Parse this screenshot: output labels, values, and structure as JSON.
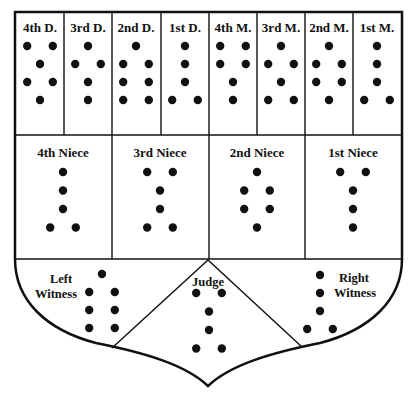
{
  "diagram": {
    "type": "shield",
    "top_row": [
      {
        "label": "4th D.",
        "dots": [
          [
            -8,
            0
          ],
          [
            8,
            0
          ],
          [
            0,
            1
          ],
          [
            -8,
            2
          ],
          [
            8,
            2
          ],
          [
            0,
            3
          ]
        ]
      },
      {
        "label": "3rd D.",
        "dots": [
          [
            0,
            0
          ],
          [
            -8,
            1
          ],
          [
            8,
            1
          ],
          [
            0,
            2
          ],
          [
            0,
            3
          ]
        ]
      },
      {
        "label": "2nd D.",
        "dots": [
          [
            0,
            0
          ],
          [
            -8,
            1
          ],
          [
            8,
            1
          ],
          [
            -8,
            2
          ],
          [
            8,
            2
          ],
          [
            -8,
            3
          ],
          [
            8,
            3
          ]
        ]
      },
      {
        "label": "1st D.",
        "dots": [
          [
            0,
            0
          ],
          [
            0,
            1
          ],
          [
            0,
            2
          ],
          [
            -8,
            3
          ],
          [
            8,
            3
          ]
        ]
      },
      {
        "label": "4th M.",
        "dots": [
          [
            -8,
            0
          ],
          [
            8,
            0
          ],
          [
            -8,
            1
          ],
          [
            8,
            1
          ],
          [
            0,
            2
          ],
          [
            0,
            3
          ]
        ]
      },
      {
        "label": "3rd M.",
        "dots": [
          [
            0,
            0
          ],
          [
            -8,
            1
          ],
          [
            8,
            1
          ],
          [
            0,
            2
          ],
          [
            -8,
            3
          ],
          [
            8,
            3
          ]
        ]
      },
      {
        "label": "2nd M.",
        "dots": [
          [
            0,
            0
          ],
          [
            -8,
            1
          ],
          [
            8,
            1
          ],
          [
            -8,
            2
          ],
          [
            8,
            2
          ],
          [
            0,
            3
          ]
        ]
      },
      {
        "label": "1st M.",
        "dots": [
          [
            0,
            0
          ],
          [
            0,
            1
          ],
          [
            0,
            2
          ],
          [
            -8,
            3
          ],
          [
            8,
            3
          ]
        ]
      }
    ],
    "middle_row": [
      {
        "label": "4th Niece",
        "dots": [
          [
            0,
            0
          ],
          [
            0,
            1
          ],
          [
            0,
            2
          ],
          [
            -8,
            3
          ],
          [
            8,
            3
          ]
        ]
      },
      {
        "label": "3rd Niece",
        "dots": [
          [
            -8,
            0
          ],
          [
            8,
            0
          ],
          [
            0,
            1
          ],
          [
            0,
            2
          ],
          [
            -8,
            3
          ],
          [
            8,
            3
          ]
        ]
      },
      {
        "label": "2nd Niece",
        "dots": [
          [
            0,
            0
          ],
          [
            -8,
            1
          ],
          [
            8,
            1
          ],
          [
            -8,
            2
          ],
          [
            8,
            2
          ],
          [
            0,
            3
          ]
        ]
      },
      {
        "label": "1st Niece",
        "dots": [
          [
            -8,
            0
          ],
          [
            8,
            0
          ],
          [
            0,
            1
          ],
          [
            0,
            2
          ],
          [
            0,
            3
          ]
        ]
      }
    ],
    "bottom": {
      "left_witness": {
        "label_line1": "Left",
        "label_line2": "Witness",
        "dots": [
          [
            0,
            0
          ],
          [
            -8,
            1
          ],
          [
            8,
            1
          ],
          [
            -8,
            2
          ],
          [
            8,
            2
          ],
          [
            -8,
            3
          ],
          [
            8,
            3
          ]
        ]
      },
      "judge": {
        "label": "Judge",
        "dots": [
          [
            -8,
            0
          ],
          [
            8,
            0
          ],
          [
            0,
            1
          ],
          [
            0,
            2
          ],
          [
            -8,
            3
          ],
          [
            8,
            3
          ]
        ]
      },
      "right_witness": {
        "label_line1": "Right",
        "label_line2": "Witness",
        "dots": [
          [
            0,
            0
          ],
          [
            0,
            1
          ],
          [
            0,
            2
          ],
          [
            -8,
            3
          ],
          [
            8,
            3
          ]
        ]
      }
    },
    "colors": {
      "ink": "#111111",
      "paper": "#ffffff"
    }
  }
}
